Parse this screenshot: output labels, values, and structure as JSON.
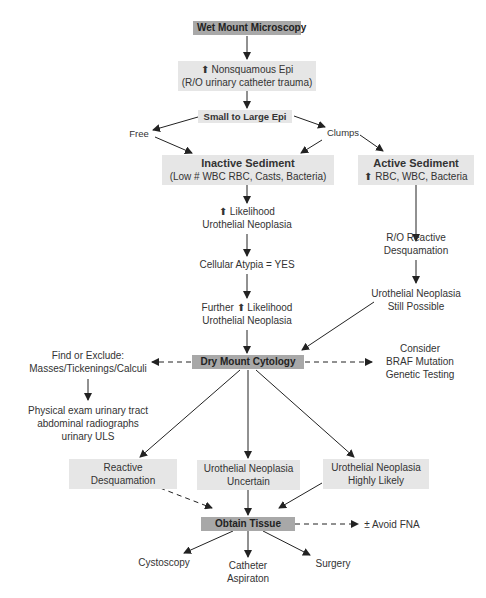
{
  "diagram": {
    "type": "flowchart",
    "colors": {
      "dark_box": "#a8a8a8",
      "light_box": "#e6e6e6",
      "text": "#333333",
      "arrow": "#222222"
    },
    "nodes": {
      "wet_mount": {
        "lines": [
          "Wet Mount Microscopy"
        ]
      },
      "nonsquamous": {
        "lines": [
          "⬆ Nonsquamous Epi",
          "(R/O urinary catheter trauma)"
        ]
      },
      "small_large": {
        "lines": [
          "Small to Large Epi"
        ]
      },
      "free": {
        "lines": [
          "Free"
        ]
      },
      "clumps": {
        "lines": [
          "Clumps"
        ]
      },
      "inactive": {
        "title": "Inactive Sediment",
        "lines": [
          "(Low # WBC RBC, Casts, Bacteria)"
        ]
      },
      "active": {
        "title": "Active Sediment",
        "lines": [
          "⬆ RBC, WBC, Bacteria"
        ]
      },
      "likelihood": {
        "lines": [
          "⬆ Likelihood",
          "Urothelial Neoplasia"
        ]
      },
      "atypia": {
        "lines": [
          "Cellular Atypia = YES"
        ]
      },
      "further": {
        "lines": [
          "Further ⬆ Likelihood",
          "Urothelial Neoplasia"
        ]
      },
      "ro_reactive": {
        "lines": [
          "R/O Reactive",
          "Desquamation"
        ]
      },
      "still_possible": {
        "lines": [
          "Urothelial Neoplasia",
          "Still Possible"
        ]
      },
      "dry_mount": {
        "lines": [
          "Dry Mount Cytology"
        ]
      },
      "find_exclude": {
        "lines": [
          "Find or Exclude:",
          "Masses/Tickenings/Calculi"
        ]
      },
      "physical_exam": {
        "lines": [
          "Physical exam urinary tract",
          "abdominal radiographs",
          "urinary ULS"
        ]
      },
      "braf": {
        "lines": [
          "Consider",
          "BRAF Mutation",
          "Genetic Testing"
        ]
      },
      "reactive_desq": {
        "lines": [
          "Reactive",
          "Desquamation"
        ]
      },
      "uncertain": {
        "lines": [
          "Urothelial Neoplasia",
          "Uncertain"
        ]
      },
      "highly_likely": {
        "lines": [
          "Urothelial Neoplasia",
          "Highly Likely"
        ]
      },
      "obtain_tissue": {
        "lines": [
          "Obtain Tissue"
        ]
      },
      "avoid_fna": {
        "lines": [
          "± Avoid FNA"
        ]
      },
      "cystoscopy": {
        "lines": [
          "Cystoscopy"
        ]
      },
      "catheter": {
        "lines": [
          "Catheter",
          "Aspiraton"
        ]
      },
      "surgery": {
        "lines": [
          "Surgery"
        ]
      }
    },
    "edges": [
      {
        "from": "wet_mount",
        "to": "nonsquamous",
        "style": "solid"
      },
      {
        "from": "nonsquamous",
        "to": "small_large",
        "style": "solid"
      },
      {
        "from": "small_large",
        "to": "free",
        "style": "solid"
      },
      {
        "from": "small_large",
        "to": "clumps",
        "style": "solid"
      },
      {
        "from": "free",
        "to": "inactive",
        "style": "solid"
      },
      {
        "from": "clumps",
        "to": "inactive",
        "style": "solid"
      },
      {
        "from": "clumps",
        "to": "active",
        "style": "solid"
      },
      {
        "from": "inactive",
        "to": "likelihood",
        "style": "solid"
      },
      {
        "from": "likelihood",
        "to": "atypia",
        "style": "solid"
      },
      {
        "from": "atypia",
        "to": "further",
        "style": "solid"
      },
      {
        "from": "further",
        "to": "dry_mount",
        "style": "solid"
      },
      {
        "from": "active",
        "to": "ro_reactive",
        "style": "solid"
      },
      {
        "from": "ro_reactive",
        "to": "still_possible",
        "style": "solid"
      },
      {
        "from": "still_possible",
        "to": "dry_mount",
        "style": "solid"
      },
      {
        "from": "dry_mount",
        "to": "find_exclude",
        "style": "dashed"
      },
      {
        "from": "dry_mount",
        "to": "braf",
        "style": "dashed"
      },
      {
        "from": "find_exclude",
        "to": "physical_exam",
        "style": "solid"
      },
      {
        "from": "dry_mount",
        "to": "reactive_desq",
        "style": "solid"
      },
      {
        "from": "dry_mount",
        "to": "uncertain",
        "style": "solid"
      },
      {
        "from": "dry_mount",
        "to": "highly_likely",
        "style": "solid"
      },
      {
        "from": "reactive_desq",
        "to": "obtain_tissue",
        "style": "dashed"
      },
      {
        "from": "uncertain",
        "to": "obtain_tissue",
        "style": "solid"
      },
      {
        "from": "highly_likely",
        "to": "obtain_tissue",
        "style": "solid"
      },
      {
        "from": "obtain_tissue",
        "to": "avoid_fna",
        "style": "dashed"
      },
      {
        "from": "obtain_tissue",
        "to": "cystoscopy",
        "style": "solid"
      },
      {
        "from": "obtain_tissue",
        "to": "catheter",
        "style": "solid"
      },
      {
        "from": "obtain_tissue",
        "to": "surgery",
        "style": "solid"
      }
    ]
  }
}
